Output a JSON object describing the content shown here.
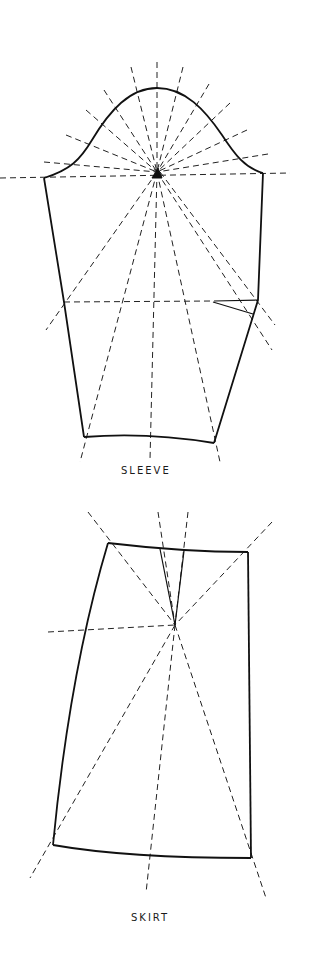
{
  "figures": [
    {
      "id": "sleeve",
      "label": "SLEEVE"
    },
    {
      "id": "skirt",
      "label": "SKIRT"
    }
  ],
  "colors": {
    "line": "#111111",
    "background": "#ffffff"
  }
}
